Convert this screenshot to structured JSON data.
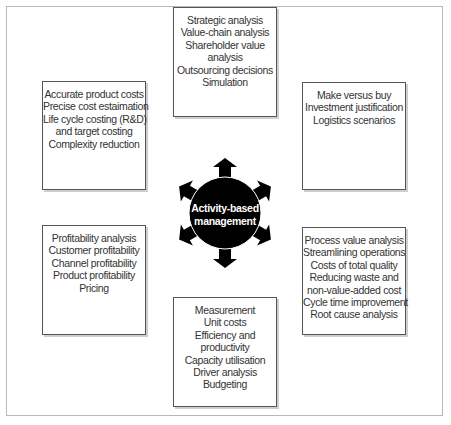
{
  "diagram": {
    "center": {
      "label_lines": [
        "Activity-based",
        "management"
      ],
      "icon": "hub-with-six-arrows-icon",
      "fill_color": "#000000",
      "text_color": "#ffffff"
    },
    "boxes": {
      "top": {
        "lines": [
          "Strategic analysis",
          "Value-chain analysis",
          "Shareholder value",
          "analysis",
          "Outsourcing decisions",
          "Simulation"
        ]
      },
      "left_top": {
        "lines": [
          "Accurate product costs",
          "Precise cost estaimation",
          "Life cycle costing (R&D)",
          "and target costing",
          "Complexity reduction"
        ]
      },
      "right_top": {
        "lines": [
          "Make versus buy",
          "Investment justification",
          "Logistics scenarios"
        ]
      },
      "left_bottom": {
        "lines": [
          "Profitability analysis",
          "Customer profitability",
          "Channel profitability",
          "Product profitability",
          "Pricing"
        ]
      },
      "right_bottom": {
        "lines": [
          "Process value analysis",
          "Streamlining operations",
          "Costs of total quality",
          "Reducing waste and",
          "non-value-added cost",
          "Cycle time improvement",
          "Root cause analysis"
        ]
      },
      "bottom": {
        "lines": [
          "Measurement",
          "Unit costs",
          "Efficiency and",
          "productivity",
          "Capacity utilisation",
          "Driver analysis",
          "Budgeting"
        ]
      }
    }
  }
}
